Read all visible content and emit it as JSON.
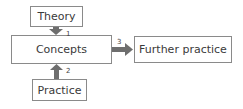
{
  "diagram": {
    "nodes": {
      "theory": "Theory",
      "concepts": "Concepts",
      "practice": "Practice",
      "further": "Further practice"
    },
    "edges": [
      {
        "from": "Theory",
        "to": "Concepts",
        "label": "1"
      },
      {
        "from": "Practice",
        "to": "Concepts",
        "label": "2"
      },
      {
        "from": "Concepts",
        "to": "Further practice",
        "label": "3"
      }
    ],
    "colors": {
      "arrow": "#6e6e6e",
      "border": "#8a8a8a",
      "text": "#3a3a3a"
    }
  }
}
